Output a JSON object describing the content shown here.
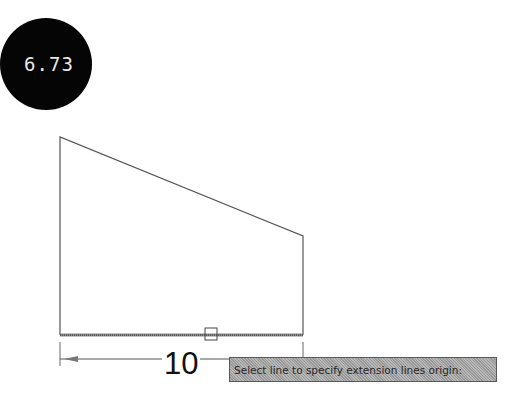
{
  "badge": {
    "label": "6.73"
  },
  "drawing": {
    "shape": "trapezoid",
    "dimension": {
      "value": "10"
    },
    "tooltip": {
      "text": "Select line to specify extension lines origin:"
    }
  }
}
